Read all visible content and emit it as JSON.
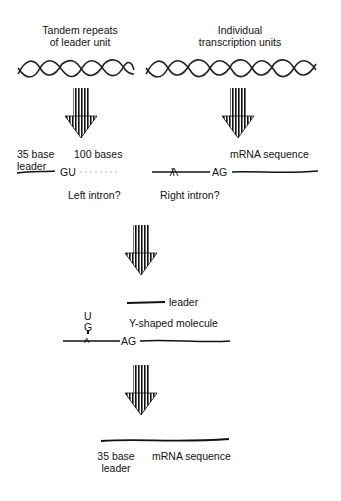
{
  "title_left": [
    "Tandem repeats",
    "of leader unit"
  ],
  "title_right": [
    "Individual",
    "transcription units"
  ],
  "step1": {
    "left_leader_label": [
      "35 base",
      "leader"
    ],
    "bases_label": "100 bases",
    "gu_label": "GU",
    "ag_label": "AG",
    "mrna_label": "mRNA sequence",
    "left_intron_label": "Left intron?",
    "right_intron_label": "Right intron?"
  },
  "step2": {
    "leader_label": "leader",
    "y_label": "Y-shaped molecule",
    "u_label": "U",
    "g_label": "G",
    "a_label": "A",
    "ag_label": "AG"
  },
  "step3": {
    "leader_label": [
      "35 base",
      "leader"
    ],
    "mrna_label": "mRNA sequence"
  },
  "colors": {
    "ink": "#111111",
    "background": "#ffffff"
  }
}
